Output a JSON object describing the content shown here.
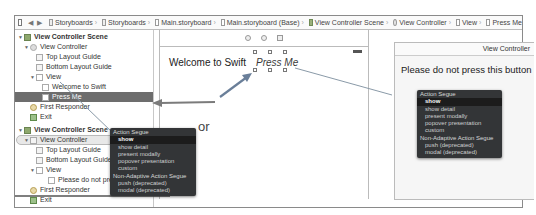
{
  "jumpbar": {
    "items": [
      {
        "label": "Storyboards",
        "icon": "folder-icon"
      },
      {
        "label": "Storyboards",
        "icon": "folder-icon"
      },
      {
        "label": "Main.storyboard",
        "icon": "storyboard-file-icon"
      },
      {
        "label": "Main.storyboard (Base)",
        "icon": "storyboard-file-icon"
      },
      {
        "label": "View Controller Scene",
        "icon": "scene-icon"
      },
      {
        "label": "View Controller",
        "icon": "view-controller-icon"
      },
      {
        "label": "View",
        "icon": "view-icon"
      },
      {
        "label": "Press Me",
        "icon": "button-icon"
      }
    ]
  },
  "outline": {
    "scene1": {
      "title": "View Controller Scene",
      "vc": "View Controller",
      "top_guide": "Top Layout Guide",
      "bottom_guide": "Bottom Layout Guide",
      "view": "View",
      "label": "Welcome to Swift",
      "button": "Press Me",
      "first_responder": "First Responder",
      "exit": "Exit"
    },
    "scene2": {
      "title": "View Controller Scene",
      "vc": "View Controller",
      "top_guide": "Top Layout Guide",
      "bottom_guide": "Bottom Layout Guide",
      "view": "View",
      "label": "Please do not press",
      "first_responder": "First Responder",
      "exit": "Exit"
    }
  },
  "canvas": {
    "scene1": {
      "label_text": "Welcome to Swift",
      "button_text": "Press Me"
    },
    "or_text": "or",
    "scene2": {
      "title": "View Controller",
      "label_text": "Please do not press this button"
    }
  },
  "segue_menu": {
    "header": "Action Segue",
    "items": [
      "show",
      "show detail",
      "present modally",
      "popover presentation",
      "custom"
    ],
    "header2": "Non-Adaptive Action Segue",
    "items2": [
      "push (deprecated)",
      "modal (deprecated)"
    ],
    "selected": "show"
  },
  "colors": {
    "menu_bg": "#333537",
    "selection": "#6d6d6d",
    "connection_line": "#8a9aa8"
  }
}
